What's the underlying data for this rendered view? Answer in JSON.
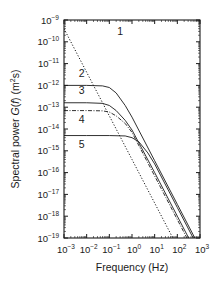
{
  "chart_data": {
    "type": "line",
    "title": "",
    "xlabel": "Frequency (Hz)",
    "ylabel": "Spectral power G(f) (m²s)",
    "xscale": "log",
    "yscale": "log",
    "xlim": [
      0.001,
      1000
    ],
    "ylim": [
      1e-19,
      1e-09
    ],
    "grid": false,
    "legend": "inline numeric labels",
    "x_ticks": [
      "10^-3",
      "10^-2",
      "10^-1",
      "10^0",
      "10^1",
      "10^2",
      "10^3"
    ],
    "y_ticks": [
      "10^-9",
      "10^-10",
      "10^-11",
      "10^-12",
      "10^-13",
      "10^-14",
      "10^-15",
      "10^-16",
      "10^-17",
      "10^-18",
      "10^-19"
    ],
    "series": [
      {
        "name": "1",
        "style": "dotted",
        "x": [
          0.001,
          0.01,
          0.1,
          1,
          10,
          100,
          200
        ],
        "y": [
          4e-10,
          4e-12,
          4e-14,
          4e-16,
          4e-18,
          4e-20,
          1e-20
        ]
      },
      {
        "name": "2",
        "style": "solid",
        "x": [
          0.001,
          0.01,
          0.05,
          0.1,
          0.2,
          0.5,
          1,
          10,
          100,
          1000
        ],
        "y": [
          1e-12,
          1e-12,
          9.5e-13,
          8e-13,
          4.5e-13,
          1.2e-13,
          3.5e-14,
          3.5e-16,
          3.5e-18,
          3.5e-20
        ]
      },
      {
        "name": "3",
        "style": "solid",
        "x": [
          0.001,
          0.01,
          0.05,
          0.1,
          0.2,
          0.5,
          1,
          10,
          100,
          1000
        ],
        "y": [
          1.6e-13,
          1.6e-13,
          1.5e-13,
          1.2e-13,
          7e-14,
          2.5e-14,
          9e-15,
          1e-16,
          1e-18,
          1e-20
        ]
      },
      {
        "name": "4",
        "style": "dash-dot",
        "x": [
          0.001,
          0.01,
          0.05,
          0.1,
          0.2,
          0.5,
          1,
          10,
          100,
          1000
        ],
        "y": [
          7e-14,
          7e-14,
          6.8e-14,
          6e-14,
          4e-14,
          1.8e-14,
          7e-15,
          7e-17,
          7e-19,
          7e-21
        ]
      },
      {
        "name": "5",
        "style": "solid",
        "x": [
          0.001,
          0.01,
          0.1,
          0.5,
          1,
          2,
          5,
          10,
          100,
          1000
        ],
        "y": [
          5e-15,
          5e-15,
          5e-15,
          4.8e-15,
          4e-15,
          2.6e-15,
          8e-16,
          2.5e-16,
          2.5e-18,
          2.5e-20
        ]
      }
    ],
    "annotations": [
      {
        "text": "1",
        "x": 0.3,
        "y": 2e-10
      },
      {
        "text": "2",
        "x": 0.006,
        "y": 2.5e-12
      },
      {
        "text": "3",
        "x": 0.006,
        "y": 4e-13
      },
      {
        "text": "4",
        "x": 0.006,
        "y": 1.8e-14
      },
      {
        "text": "5",
        "x": 0.006,
        "y": 1.3e-15
      }
    ]
  },
  "labels": {
    "xlabel": "Frequency (Hz)",
    "ylabel_main": "Spectral power ",
    "ylabel_fn": "G",
    "ylabel_paren": "(",
    "ylabel_var": "f",
    "ylabel_tail": ") (m",
    "ylabel_sup": "2",
    "ylabel_end": "s)"
  }
}
